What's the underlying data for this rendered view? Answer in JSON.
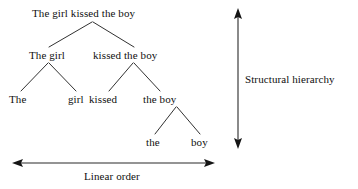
{
  "diagram": {
    "title_visible": false,
    "ink_color": "#100f0f",
    "background_color": "#ffffff",
    "tree": {
      "levels": [
        {
          "level": 0,
          "nodes": [
            {
              "id": "s",
              "label": "The girl kissed the boy",
              "x": 92,
              "y": 13
            }
          ]
        },
        {
          "level": 1,
          "nodes": [
            {
              "id": "np1",
              "label": "The girl",
              "x": 49,
              "y": 55
            },
            {
              "id": "vp1",
              "label": "kissed the boy",
              "x": 134,
              "y": 55
            }
          ]
        },
        {
          "level": 2,
          "nodes": [
            {
              "id": "det1",
              "label": "The",
              "x": 20,
              "y": 99
            },
            {
              "id": "n1",
              "label": "girl",
              "x": 76,
              "y": 99
            },
            {
              "id": "v1",
              "label": "kissed",
              "x": 105,
              "y": 99
            },
            {
              "id": "np2",
              "label": "the boy",
              "x": 161,
              "y": 99
            }
          ]
        },
        {
          "level": 3,
          "nodes": [
            {
              "id": "det2",
              "label": "the",
              "x": 155,
              "y": 142
            },
            {
              "id": "n2",
              "label": "boy",
              "x": 201,
              "y": 142
            }
          ]
        }
      ],
      "edges": [
        {
          "from": "s",
          "to": "np1",
          "x1": 92,
          "y1": 22,
          "x2": 49,
          "y2": 47
        },
        {
          "from": "s",
          "to": "vp1",
          "x1": 93,
          "y1": 22,
          "x2": 134,
          "y2": 47
        },
        {
          "from": "np1",
          "to": "det1",
          "x1": 48,
          "y1": 63,
          "x2": 21,
          "y2": 91
        },
        {
          "from": "np1",
          "to": "n1",
          "x1": 49,
          "y1": 63,
          "x2": 76,
          "y2": 91
        },
        {
          "from": "vp1",
          "to": "v1",
          "x1": 133,
          "y1": 63,
          "x2": 109,
          "y2": 91
        },
        {
          "from": "vp1",
          "to": "np2",
          "x1": 134,
          "y1": 63,
          "x2": 160,
          "y2": 91
        },
        {
          "from": "np2",
          "to": "det2",
          "x1": 176,
          "y1": 107,
          "x2": 155,
          "y2": 134
        },
        {
          "from": "np2",
          "to": "n2",
          "x1": 177,
          "y1": 107,
          "x2": 200,
          "y2": 134
        }
      ]
    },
    "axes": {
      "vertical": {
        "label": "Structural hierarchy",
        "label_x": 245,
        "label_y": 79,
        "x": 238,
        "y_top": 11,
        "y_bottom": 146,
        "arrowheads": "both"
      },
      "horizontal": {
        "label": "Linear order",
        "label_x": 114,
        "label_y": 176,
        "y": 163,
        "x_left": 15,
        "x_right": 212,
        "arrowheads": "both"
      }
    }
  }
}
